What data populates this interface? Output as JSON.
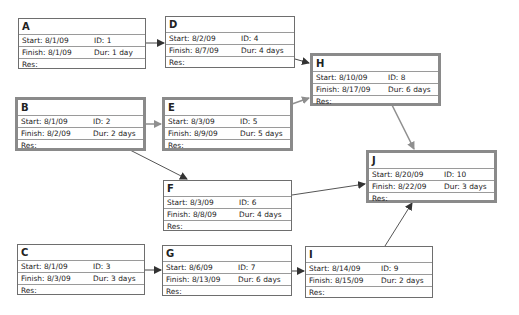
{
  "labels": {
    "start": "Start:",
    "finish": "Finish:",
    "id": "ID:",
    "dur": "Dur:",
    "res": "Res:"
  },
  "colors": {
    "critical_border": "#8a8a8a",
    "normal_border": "#6e6e6e",
    "critical_arrow": "#8f8f8f",
    "normal_arrow": "#444444"
  },
  "nodes": {
    "A": {
      "name": "A",
      "start": "Start:  8/1/09",
      "finish": "Finish: 8/1/09",
      "id": "ID:  1",
      "dur": "Dur: 1 day",
      "res": "Res:",
      "critical": false
    },
    "B": {
      "name": "B",
      "start": "Start:  8/1/09",
      "finish": "Finish: 8/2/09",
      "id": "ID:  2",
      "dur": "Dur: 2 days",
      "res": "Res:",
      "critical": true
    },
    "C": {
      "name": "C",
      "start": "Start:  8/1/09",
      "finish": "Finish: 8/3/09",
      "id": "ID:  3",
      "dur": "Dur: 3 days",
      "res": "Res:",
      "critical": false
    },
    "D": {
      "name": "D",
      "start": "Start:  8/2/09",
      "finish": "Finish: 8/7/09",
      "id": "ID:  4",
      "dur": "Dur: 4 days",
      "res": "Res:",
      "critical": false
    },
    "E": {
      "name": "E",
      "start": "Start:  8/3/09",
      "finish": "Finish: 8/9/09",
      "id": "ID:  5",
      "dur": "Dur: 5 days",
      "res": "Res:",
      "critical": true
    },
    "F": {
      "name": "F",
      "start": "Start:  8/3/09",
      "finish": "Finish: 8/8/09",
      "id": "ID:  6",
      "dur": "Dur: 4 days",
      "res": "Res:",
      "critical": false
    },
    "G": {
      "name": "G",
      "start": "Start:  8/6/09",
      "finish": "Finish: 8/13/09",
      "id": "ID:  7",
      "dur": "Dur: 6 days",
      "res": "Res:",
      "critical": false
    },
    "H": {
      "name": "H",
      "start": "Start:  8/10/09",
      "finish": "Finish: 8/17/09",
      "id": "ID:  8",
      "dur": "Dur: 6 days",
      "res": "Res:",
      "critical": true
    },
    "I": {
      "name": "I",
      "start": "Start:  8/14/09",
      "finish": "Finish: 8/15/09",
      "id": "ID:  9",
      "dur": "Dur: 2 days",
      "res": "Res:",
      "critical": false
    },
    "J": {
      "name": "J",
      "start": "Start:  8/20/09",
      "finish": "Finish: 8/22/09",
      "id": "ID:  10",
      "dur": "Dur: 3 days",
      "res": "Res:",
      "critical": true
    }
  },
  "links": [
    {
      "from": "A",
      "to": "D",
      "critical": false
    },
    {
      "from": "B",
      "to": "E",
      "critical": true
    },
    {
      "from": "B",
      "to": "F",
      "critical": false
    },
    {
      "from": "D",
      "to": "H",
      "critical": false
    },
    {
      "from": "E",
      "to": "H",
      "critical": true
    },
    {
      "from": "H",
      "to": "J",
      "critical": true
    },
    {
      "from": "F",
      "to": "J",
      "critical": false
    },
    {
      "from": "C",
      "to": "G",
      "critical": false
    },
    {
      "from": "G",
      "to": "I",
      "critical": false
    },
    {
      "from": "I",
      "to": "J",
      "critical": false
    }
  ]
}
